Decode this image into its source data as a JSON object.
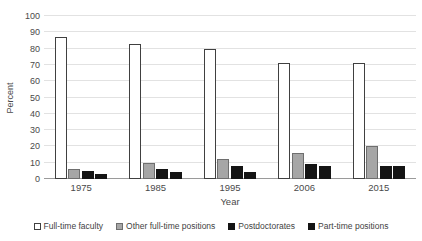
{
  "chart_data": {
    "type": "bar",
    "title": "",
    "xlabel": "Year",
    "ylabel": "Percent",
    "categories": [
      "1975",
      "1985",
      "1995",
      "2006",
      "2015"
    ],
    "series": [
      {
        "name": "Full-time faculty",
        "values": [
          87,
          83,
          80,
          71,
          71
        ],
        "color": "#ffffff"
      },
      {
        "name": "Other full-time positions",
        "values": [
          6,
          10,
          12,
          16,
          20
        ],
        "color": "#a6a6a6"
      },
      {
        "name": "Postdoctorates",
        "values": [
          5,
          6,
          8,
          9,
          8
        ],
        "color": "#141414"
      },
      {
        "name": "Part-time positions",
        "values": [
          3,
          4,
          4,
          8,
          8
        ],
        "color": "#141414"
      }
    ],
    "ylim": [
      0,
      100
    ],
    "yticks": [
      100,
      90,
      80,
      70,
      60,
      50,
      40,
      30,
      20,
      10,
      0
    ],
    "grid": true,
    "legend_position": "bottom"
  },
  "colors": {
    "gridline": "#e2e2e2",
    "axis": "#9a9a9a",
    "text": "#4a4a4a",
    "background": "#ffffff"
  }
}
